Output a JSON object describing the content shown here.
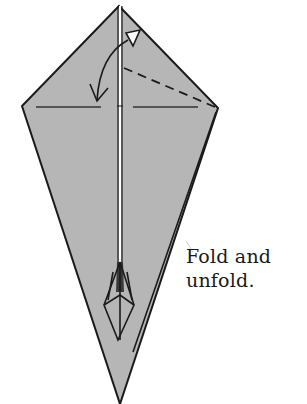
{
  "diagram": {
    "type": "origami-step",
    "paper_fill": "#b6b6b6",
    "line_color": "#1a1a1a",
    "shape": "kite",
    "elements": [
      "center-crease-double-line",
      "horizontal-crease-left",
      "horizontal-crease-right",
      "dashed-valley-fold-line",
      "curved-fold-unfold-arrow",
      "inner-flap-diamond",
      "right-edge-layer-line"
    ]
  },
  "caption": {
    "line1": "Fold and",
    "line2": "unfold."
  }
}
